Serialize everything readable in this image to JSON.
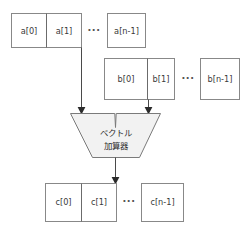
{
  "diagram": {
    "canvas": {
      "width": 250,
      "height": 231,
      "background": "#ffffff"
    },
    "colors": {
      "box_border": "#888888",
      "box_fill": "#ffffff",
      "divider": "#6b6b6b",
      "adder_fill": "#f2f2f2",
      "adder_border": "#7a7a7a",
      "arrow": "#4a4a4a",
      "arrowhead": "#2b2b2b",
      "text": "#3a3a3a"
    },
    "rows": [
      {
        "id": "vector-a",
        "name": "operand-a",
        "y": 13,
        "height": 35,
        "group": {
          "x": 11,
          "width": 71,
          "cells": [
            "a[0]",
            "a[1]"
          ]
        },
        "ellipsis": "···",
        "ellipsis_x": 94,
        "tail": {
          "x": 107,
          "width": 39,
          "label": "a[n-1]"
        }
      },
      {
        "id": "vector-b",
        "name": "operand-b",
        "y": 58,
        "height": 42,
        "group": {
          "x": 104,
          "width": 71,
          "cells": [
            "b[0]",
            "b[1]"
          ]
        },
        "ellipsis": "···",
        "ellipsis_x": 188,
        "tail": {
          "x": 200,
          "width": 40,
          "label": "b[n-1]"
        }
      },
      {
        "id": "vector-c",
        "name": "result-c",
        "y": 183,
        "height": 39,
        "group": {
          "x": 45,
          "width": 72,
          "cells": [
            "c[0]",
            "c[1]"
          ]
        },
        "ellipsis": "···",
        "ellipsis_x": 129,
        "tail": {
          "x": 141,
          "width": 43,
          "label": "c[n-1]"
        }
      }
    ],
    "adder": {
      "name": "vector-adder",
      "label_line1": "ベクトル",
      "label_line2": "加算器",
      "top_left_x": 70,
      "top_right_x": 161,
      "bottom_left_x": 92,
      "bottom_right_x": 139,
      "top_y": 113,
      "bottom_y": 158,
      "notch_x": 115,
      "notch_y": 127
    },
    "connections": [
      {
        "name": "a-to-adder",
        "from": "vector-a",
        "to": "adder-left-input",
        "x": 81,
        "y1": 48,
        "y2": 110
      },
      {
        "name": "b-to-adder",
        "from": "vector-b",
        "to": "adder-right-input",
        "x": 148,
        "y1": 100,
        "y2": 110
      },
      {
        "name": "adder-to-c",
        "from": "adder",
        "to": "vector-c",
        "x": 115,
        "y1": 158,
        "y2": 180
      }
    ]
  }
}
